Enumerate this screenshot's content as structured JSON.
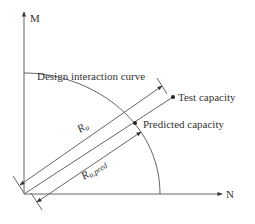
{
  "diagram": {
    "axes": {
      "y_label": "M",
      "x_label": "N"
    },
    "curve_label": "Design interaction curve",
    "points": {
      "test": "Test capacity",
      "predicted": "Predicted capacity"
    },
    "dimensions": {
      "test_length": "R",
      "test_length_sub": "u",
      "pred_length": "R",
      "pred_length_sub": "u,pred"
    },
    "colors": {
      "line": "#555555",
      "text": "#333333",
      "background": "#ffffff"
    }
  }
}
